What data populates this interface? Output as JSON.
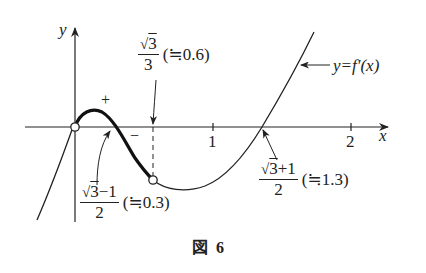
{
  "figure": {
    "caption_prefix": "図",
    "caption_number": "6",
    "axis_x_label": "x",
    "axis_y_label": "y",
    "tick_1": "1",
    "tick_2": "2",
    "curve_label": "y=f′(x)",
    "sign_positive": "+",
    "sign_negative": "−",
    "annot_sqrt3_over_3": {
      "num_sqrt": "√",
      "num_radicand": "3",
      "den": "3",
      "approx": "(≒0.6)"
    },
    "annot_root_small": {
      "num_sqrt": "√",
      "num_radicand": "3",
      "num_rest": "−1",
      "den": "2",
      "approx": "(≒0.3)"
    },
    "annot_root_large": {
      "num_sqrt": "√",
      "num_radicand": "3",
      "num_rest": "+1",
      "den": "2",
      "approx": "(≒1.3)"
    }
  }
}
